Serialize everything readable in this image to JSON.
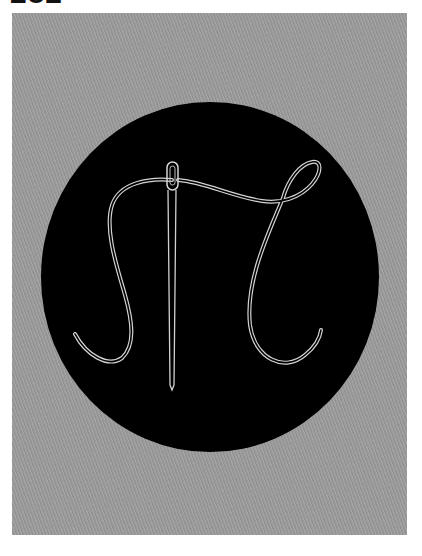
{
  "page_label": "282",
  "artwork": {
    "subject": "needle-and-thread-monogram",
    "background_color": "#9a9a9a",
    "disc_color": "#000000",
    "thread_color": "#d8d8d8",
    "disc": {
      "cx": 210,
      "cy": 277,
      "rx": 169,
      "ry": 175
    },
    "needle": {
      "x": 172,
      "eye_top": 162,
      "eye_bottom": 190,
      "tip_y": 388
    }
  }
}
